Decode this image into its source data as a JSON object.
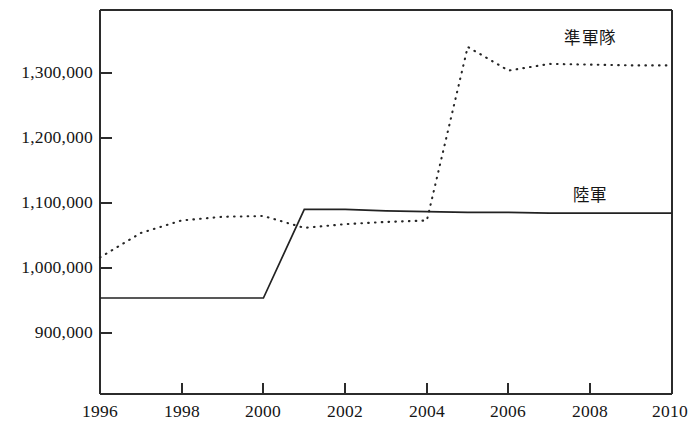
{
  "chart_data": {
    "type": "line",
    "title": "",
    "subtitle": "",
    "xlabel": "",
    "ylabel": "",
    "xlim": [
      1996,
      2010
    ],
    "ylim": [
      850000,
      1370000
    ],
    "grid": false,
    "legend_position": "inline-right",
    "x": [
      1996,
      1997,
      1998,
      1999,
      2000,
      2001,
      2002,
      2003,
      2004,
      2005,
      2006,
      2007,
      2008,
      2009,
      2010
    ],
    "xticks": [
      1996,
      1998,
      2000,
      2002,
      2004,
      2006,
      2008,
      2010
    ],
    "xtick_labels": [
      "1996",
      "1998",
      "2000",
      "2002",
      "2004",
      "2006",
      "2008",
      "2010"
    ],
    "yticks": [
      900000,
      1000000,
      1100000,
      1200000,
      1300000
    ],
    "ytick_labels": [
      "900,000",
      "1,000,000",
      "1,100,000",
      "1,200,000",
      "1,300,000"
    ],
    "series": [
      {
        "name": "陸軍",
        "style": "solid",
        "color": "#222222",
        "annotation": "陸軍",
        "annotation_x": 2008,
        "annotation_y": 1117000,
        "values": [
          980000,
          980000,
          980000,
          980000,
          980000,
          1100000,
          1100000,
          1098000,
          1097000,
          1096000,
          1096000,
          1095000,
          1095000,
          1095000,
          1095000
        ]
      },
      {
        "name": "準軍隊",
        "style": "dotted",
        "color": "#262626",
        "annotation": "準軍隊",
        "annotation_x": 2008,
        "annotation_y": 1330000,
        "values": [
          1035000,
          1068000,
          1085000,
          1090000,
          1091000,
          1075000,
          1080000,
          1083000,
          1085000,
          1320000,
          1288000,
          1297000,
          1296000,
          1295000,
          1295000
        ]
      }
    ]
  },
  "axes": {
    "frame": {
      "left_px": 100,
      "right_px": 672,
      "top_px": 10,
      "bottom_px": 394
    }
  }
}
